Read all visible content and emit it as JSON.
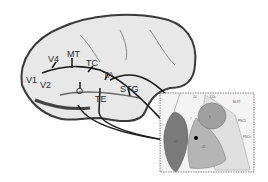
{
  "figure": {
    "brain_labels": [
      "V1",
      "V2",
      "V4",
      "MT",
      "TC",
      "TA",
      "O",
      "TE",
      "STG"
    ],
    "inset_labels": [
      "10",
      "CDs",
      "BLST",
      "PNC1",
      "PNCv",
      "45",
      "44",
      "6",
      "7",
      "8"
    ],
    "colors": {
      "brain_fill": "#e8e8e8",
      "brain_dark": "#333333",
      "area_dark": "#7a7a7a",
      "area_mid": "#a8a8a8",
      "area_light": "#cfcfcf",
      "inset_bg": "#f4f4f4",
      "arrow": "#1a1a1a"
    }
  }
}
